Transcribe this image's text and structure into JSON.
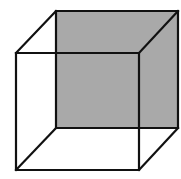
{
  "diagram": {
    "title": "",
    "type": "necker-cube",
    "width": 181,
    "height": 179,
    "colors": {
      "background": "#ffffff",
      "stroke": "#111111",
      "shaded_face": "#a9a9a9"
    },
    "stroke_width": 2.2,
    "back_face": {
      "shaded": true,
      "corners": {
        "top_left": [
          56,
          11
        ],
        "top_right": [
          178,
          11
        ],
        "bottom_right": [
          178,
          128
        ],
        "bottom_left": [
          56,
          128
        ]
      }
    },
    "front_face": {
      "shaded": false,
      "corners": {
        "top_left": [
          16,
          53
        ],
        "top_right": [
          139,
          53
        ],
        "bottom_right": [
          139,
          170
        ],
        "bottom_left": [
          16,
          170
        ]
      }
    },
    "connecting_edges": [
      {
        "from": "front.top_left",
        "to": "back.top_left"
      },
      {
        "from": "front.top_right",
        "to": "back.top_right"
      },
      {
        "from": "front.bottom_right",
        "to": "back.bottom_right"
      },
      {
        "from": "front.bottom_left",
        "to": "back.bottom_left"
      }
    ]
  }
}
